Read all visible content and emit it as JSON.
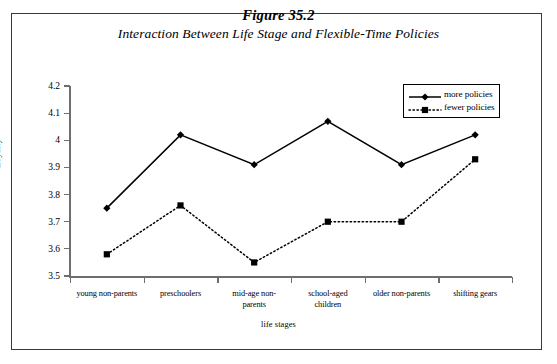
{
  "figure": {
    "number": "Figure 35.2",
    "subtitle": "Interaction  Between Life Stage and Flexible-Time Policies"
  },
  "chart_data": {
    "type": "line",
    "title": "Figure 35.2",
    "subtitle": "Interaction  Between Life Stage and Flexible-Time Policies",
    "xlabel": "life stages",
    "ylabel": "Loyalty",
    "ylim": [
      3.5,
      4.2
    ],
    "ytick_labels": [
      "4.2",
      "4.1",
      "4",
      "3.9",
      "3.8",
      "3.7",
      "3.6",
      "3.5"
    ],
    "yticks": [
      4.2,
      4.1,
      4.0,
      3.9,
      3.8,
      3.7,
      3.6,
      3.5
    ],
    "grid": false,
    "legend_position": "top-right",
    "categories": [
      "young non-parents",
      "preschoolers",
      "mid-age non-parents",
      "school-aged children",
      "older non-parents",
      "shifting gears"
    ],
    "category_lines": [
      [
        "young non-parents"
      ],
      [
        "preschoolers"
      ],
      [
        "mid-age non-",
        "parents"
      ],
      [
        "school-aged",
        "children"
      ],
      [
        "older non-parents"
      ],
      [
        "shifting gears"
      ]
    ],
    "series": [
      {
        "name": "more policies",
        "style": "solid",
        "marker": "diamond",
        "color": "#000000",
        "values": [
          3.75,
          4.02,
          3.91,
          4.07,
          3.91,
          4.02
        ]
      },
      {
        "name": "fewer policies",
        "style": "dotted",
        "marker": "square",
        "color": "#000000",
        "values": [
          3.58,
          3.76,
          3.55,
          3.7,
          3.7,
          3.93
        ]
      }
    ]
  }
}
